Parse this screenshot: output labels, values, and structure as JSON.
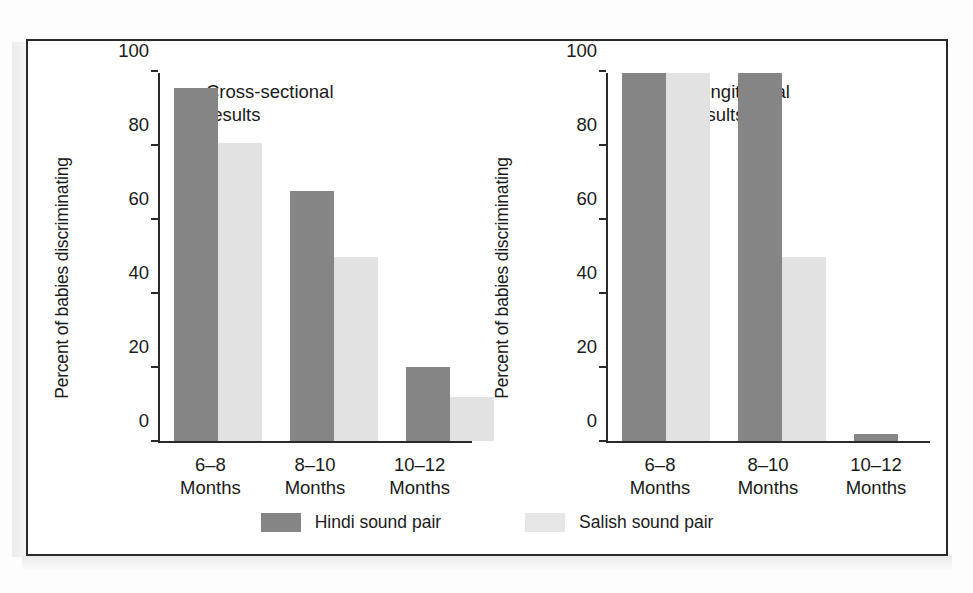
{
  "figure": {
    "background_color": "#ffffff",
    "frame_color": "#2a2a2a",
    "hindi_color": "#858585",
    "salish_color": "#e2e2e2"
  },
  "panels": [
    {
      "id": "cross-sectional",
      "caption": "Cross-sectional\nresults",
      "ylabel": "Percent of babies discriminating"
    },
    {
      "id": "longitudinal",
      "caption": "Longitudinal\nresults",
      "ylabel": "Percent of babies discriminating"
    }
  ],
  "yticks": [
    "0",
    "20",
    "40",
    "60",
    "80",
    "100"
  ],
  "xlabels": [
    "6–8\nMonths",
    "8–10\nMonths",
    "10–12\nMonths"
  ],
  "legend": {
    "items": [
      {
        "label": "Hindi sound pair",
        "color": "#858585"
      },
      {
        "label": "Salish sound pair",
        "color": "#e6e6e6"
      }
    ]
  },
  "chart_data": [
    {
      "type": "bar",
      "title": "Cross-sectional results",
      "xlabel": "",
      "ylabel": "Percent of babies discriminating",
      "categories": [
        "6–8 Months",
        "8–10 Months",
        "10–12 Months"
      ],
      "series": [
        {
          "name": "Hindi sound pair",
          "color": "#858585",
          "values": [
            96,
            68,
            20
          ]
        },
        {
          "name": "Salish sound pair",
          "color": "#e2e2e2",
          "values": [
            81,
            50,
            12
          ]
        }
      ],
      "ylim": [
        0,
        100
      ],
      "yticks": [
        0,
        20,
        40,
        60,
        80,
        100
      ],
      "grid": false,
      "legend_position": "bottom-center"
    },
    {
      "type": "bar",
      "title": "Longitudinal results",
      "xlabel": "",
      "ylabel": "Percent of babies discriminating",
      "categories": [
        "6–8 Months",
        "8–10 Months",
        "10–12 Months"
      ],
      "series": [
        {
          "name": "Hindi sound pair",
          "color": "#858585",
          "values": [
            100,
            100,
            2
          ]
        },
        {
          "name": "Salish sound pair",
          "color": "#e2e2e2",
          "values": [
            100,
            50,
            0
          ]
        }
      ],
      "ylim": [
        0,
        100
      ],
      "yticks": [
        0,
        20,
        40,
        60,
        80,
        100
      ],
      "grid": false,
      "legend_position": "bottom-center"
    }
  ]
}
